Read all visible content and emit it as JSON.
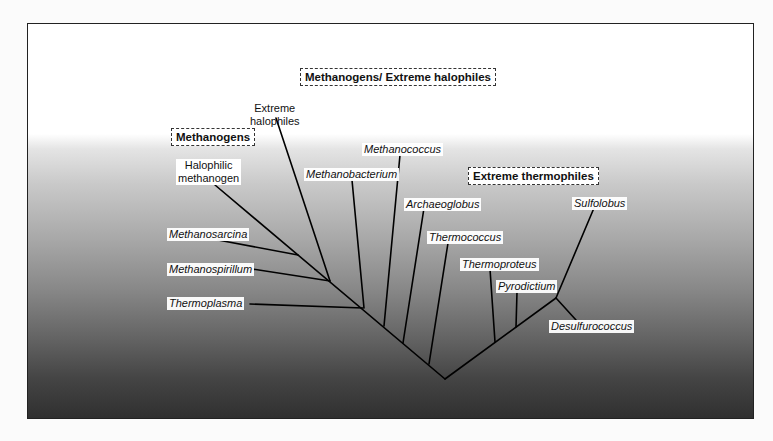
{
  "figure": {
    "groups": {
      "methanogens_halophiles": "Methanogens/ Extreme halophiles",
      "methanogens": "Methanogens",
      "extreme_thermophiles": "Extreme thermophiles"
    },
    "taxa": {
      "extreme_halophiles": [
        "Extreme",
        "halophiles"
      ],
      "halophilic_methanogen": [
        "Halophilic",
        "methanogen"
      ],
      "methanosarcina": "Methanosarcina",
      "methanospirillum": "Methanospirillum",
      "thermoplasma": "Thermoplasma",
      "methanobacterium": "Methanobacterium",
      "methanococcus": "Methanococcus",
      "archaeoglobus": "Archaeoglobus",
      "thermococcus": "Thermococcus",
      "thermoproteus": "Thermoproteus",
      "pyrodictium": "Pyrodictium",
      "sulfolobus": "Sulfolobus",
      "desulfurococcus": "Desulfurococcus"
    },
    "colors": {
      "background_top": "#ffffff",
      "background_bottom": "#2f2f2f",
      "line": "#000000"
    }
  }
}
